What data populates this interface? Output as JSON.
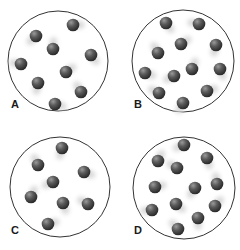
{
  "figure": {
    "colors": {
      "background": "#ffffff",
      "container_stroke": "#333333",
      "particle_dark": "#3a3a3a",
      "particle_light": "#8a8a8a",
      "trail": "#d8d8d8",
      "label": "#1a1a1a"
    },
    "panels": [
      {
        "label": "A",
        "cx": 58,
        "cy": 61,
        "r": 50,
        "label_x": 11,
        "label_y": 107,
        "particles": [
          [
            73,
            25
          ],
          [
            36,
            36
          ],
          [
            53,
            49
          ],
          [
            91,
            55
          ],
          [
            21,
            64
          ],
          [
            66,
            72
          ],
          [
            38,
            83
          ],
          [
            81,
            92
          ],
          [
            55,
            104
          ]
        ]
      },
      {
        "label": "B",
        "cx": 183,
        "cy": 61,
        "r": 51,
        "label_x": 134,
        "label_y": 107,
        "particles": [
          [
            166,
            23
          ],
          [
            199,
            24
          ],
          [
            181,
            44
          ],
          [
            216,
            45
          ],
          [
            158,
            53
          ],
          [
            145,
            73
          ],
          [
            174,
            76
          ],
          [
            192,
            69
          ],
          [
            220,
            69
          ],
          [
            159,
            93
          ],
          [
            207,
            91
          ],
          [
            183,
            103
          ]
        ]
      },
      {
        "label": "C",
        "cx": 60,
        "cy": 187,
        "r": 50,
        "label_x": 11,
        "label_y": 233,
        "particles": [
          [
            62,
            148
          ],
          [
            38,
            165
          ],
          [
            84,
            172
          ],
          [
            53,
            182
          ],
          [
            31,
            197
          ],
          [
            63,
            203
          ],
          [
            88,
            204
          ],
          [
            48,
            224
          ]
        ]
      },
      {
        "label": "D",
        "cx": 184,
        "cy": 188,
        "r": 51,
        "label_x": 134,
        "label_y": 233,
        "particles": [
          [
            184,
            145
          ],
          [
            158,
            161
          ],
          [
            207,
            158
          ],
          [
            177,
            168
          ],
          [
            155,
            187
          ],
          [
            195,
            188
          ],
          [
            217,
            184
          ],
          [
            176,
            204
          ],
          [
            152,
            210
          ],
          [
            215,
            206
          ],
          [
            198,
            218
          ],
          [
            178,
            229
          ]
        ]
      }
    ]
  }
}
